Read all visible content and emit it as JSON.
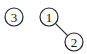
{
  "diagram": {
    "type": "graph",
    "nodes": [
      {
        "id": "3",
        "label": "3",
        "cx": 14,
        "cy": 17,
        "r": 9
      },
      {
        "id": "1",
        "label": "1",
        "cx": 49,
        "cy": 17,
        "r": 9
      },
      {
        "id": "2",
        "label": "2",
        "cx": 74,
        "cy": 42,
        "r": 9
      }
    ],
    "edges": [
      {
        "from": "1",
        "to": "2"
      }
    ]
  }
}
